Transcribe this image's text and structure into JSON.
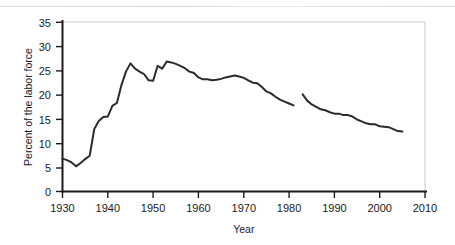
{
  "chart_data": {
    "type": "line",
    "title": "",
    "xlabel": "Year",
    "ylabel": "Percent of the labor force",
    "xlim": [
      1930,
      2010
    ],
    "ylim": [
      0,
      35
    ],
    "xticks": [
      1930,
      1940,
      1950,
      1960,
      1970,
      1980,
      1990,
      2000,
      2010
    ],
    "yticks": [
      0,
      5,
      10,
      15,
      20,
      25,
      30,
      35
    ],
    "grid": false,
    "legend": "none",
    "line_color": "#2b2b2b",
    "series": [
      {
        "name": "Union membership",
        "x": [
          1930,
          1931,
          1932,
          1933,
          1934,
          1935,
          1936,
          1937,
          1938,
          1939,
          1940,
          1941,
          1942,
          1943,
          1944,
          1945,
          1946,
          1947,
          1948,
          1949,
          1950,
          1951,
          1952,
          1953,
          1954,
          1955,
          1956,
          1957,
          1958,
          1959,
          1960,
          1961,
          1962,
          1963,
          1964,
          1965,
          1966,
          1967,
          1968,
          1969,
          1970,
          1971,
          1972,
          1973,
          1974,
          1975,
          1976,
          1977,
          1978,
          1979,
          1980,
          1981
        ],
        "values": [
          6.8,
          6.5,
          6.0,
          5.2,
          5.9,
          6.7,
          7.4,
          12.9,
          14.6,
          15.4,
          15.5,
          17.7,
          18.3,
          22.0,
          24.8,
          26.5,
          25.4,
          24.8,
          24.3,
          23.0,
          22.9,
          26.0,
          25.4,
          26.9,
          26.7,
          26.4,
          26.0,
          25.5,
          24.8,
          24.5,
          23.6,
          23.2,
          23.2,
          23.0,
          23.1,
          23.3,
          23.6,
          23.8,
          24.0,
          23.8,
          23.5,
          23.0,
          22.5,
          22.4,
          21.6,
          20.7,
          20.3,
          19.6,
          19.0,
          18.6,
          18.2,
          17.8
        ]
      },
      {
        "name": "Union membership (revised series)",
        "x": [
          1983,
          1984,
          1985,
          1986,
          1987,
          1988,
          1989,
          1990,
          1991,
          1992,
          1993,
          1994,
          1995,
          1996,
          1997,
          1998,
          1999,
          2000,
          2001,
          2002,
          2003,
          2004,
          2005
        ],
        "values": [
          20.1,
          18.8,
          18.0,
          17.5,
          17.0,
          16.8,
          16.4,
          16.1,
          16.1,
          15.8,
          15.8,
          15.5,
          14.9,
          14.5,
          14.1,
          13.9,
          13.9,
          13.5,
          13.4,
          13.3,
          12.9,
          12.5,
          12.4
        ]
      }
    ]
  },
  "axes": {
    "y_title": "Percent of the labor force",
    "x_title": "Year",
    "y_tick_labels": [
      "35",
      "30",
      "25",
      "20",
      "15",
      "10",
      "5",
      "0"
    ],
    "x_tick_labels": [
      "1930",
      "1940",
      "1950",
      "1960",
      "1970",
      "1980",
      "1990",
      "2000",
      "2010"
    ]
  }
}
